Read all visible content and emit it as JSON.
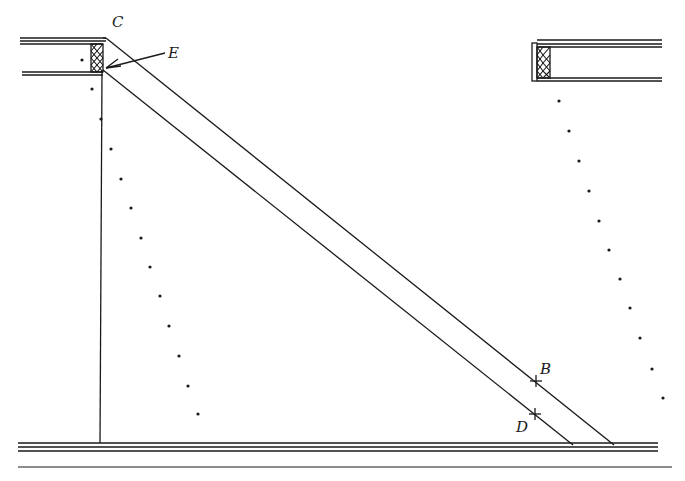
{
  "diagram": {
    "labels": {
      "C": "C",
      "E": "E",
      "B": "B",
      "D": "D"
    },
    "colors": {
      "ink": "#1a1a1a",
      "background": "#ffffff"
    },
    "left_dots": [
      [
        82,
        60
      ],
      [
        92,
        89
      ],
      [
        101,
        119
      ],
      [
        111,
        149
      ],
      [
        121,
        179
      ],
      [
        131,
        208
      ],
      [
        141,
        238
      ],
      [
        150,
        267
      ],
      [
        160,
        296
      ],
      [
        169,
        326
      ],
      [
        179,
        356
      ],
      [
        188,
        386
      ],
      [
        198,
        414
      ]
    ],
    "right_dots": [
      [
        559,
        101
      ],
      [
        569,
        131
      ],
      [
        579,
        161
      ],
      [
        589,
        191
      ],
      [
        599,
        221
      ],
      [
        609,
        250
      ],
      [
        620,
        279
      ],
      [
        630,
        308
      ],
      [
        640,
        338
      ],
      [
        652,
        369
      ],
      [
        663,
        398
      ]
    ]
  }
}
